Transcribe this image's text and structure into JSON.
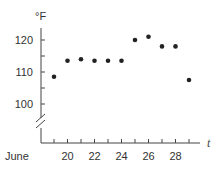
{
  "chart_data": {
    "type": "scatter",
    "title": "",
    "xlabel": "t",
    "ylabel": "°F",
    "x_prefix_label": "June",
    "x": [
      19,
      20,
      21,
      22,
      23,
      24,
      25,
      26,
      27,
      28,
      29
    ],
    "values": [
      108.5,
      113.5,
      114,
      113.5,
      113.5,
      113.5,
      120,
      121,
      118,
      118,
      107.5
    ],
    "series": [
      {
        "name": "Daily high temperature",
        "x": [
          19,
          20,
          21,
          22,
          23,
          24,
          25,
          26,
          27,
          28,
          29
        ],
        "values": [
          108.5,
          113.5,
          114,
          113.5,
          113.5,
          113.5,
          120,
          121,
          118,
          118,
          107.5
        ]
      }
    ],
    "xticks": [
      19,
      20,
      21,
      22,
      23,
      24,
      25,
      26,
      27,
      28,
      29
    ],
    "xtick_labels": [
      "20",
      "22",
      "24",
      "26",
      "28"
    ],
    "yticks": [
      100,
      105,
      110,
      115,
      120
    ],
    "ytick_labels": [
      "120",
      "110",
      "100"
    ],
    "ylim": [
      100,
      122
    ],
    "y_axis_break": true,
    "grid": false,
    "legend": "none"
  },
  "labels": {
    "unit": "°F",
    "t": "t",
    "month": "June",
    "y120": "120",
    "y110": "110",
    "y100": "100",
    "x20": "20",
    "x22": "22",
    "x24": "24",
    "x26": "26",
    "x28": "28"
  },
  "colors": {
    "points": "#222222",
    "axis": "#444444",
    "text": "#333333"
  }
}
